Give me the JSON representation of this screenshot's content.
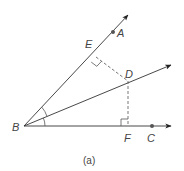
{
  "diagram": {
    "caption": "(a)",
    "points": {
      "A": {
        "label": "A",
        "x": 113,
        "y": 32
      },
      "B": {
        "label": "B",
        "x": 24,
        "y": 126
      },
      "C": {
        "label": "C",
        "x": 152,
        "y": 126
      },
      "D": {
        "label": "D",
        "x": 128,
        "y": 81
      },
      "E": {
        "label": "E",
        "x": 96,
        "y": 57
      },
      "F": {
        "label": "F",
        "x": 128,
        "y": 126
      }
    },
    "rays": [
      {
        "name": "ray-BA",
        "from": "B",
        "through": "A"
      },
      {
        "name": "ray-BD",
        "from": "B",
        "through": "D",
        "note": "angle bisector"
      },
      {
        "name": "ray-BC",
        "from": "B",
        "through": "C"
      }
    ],
    "dashed_segments": [
      {
        "name": "DE",
        "from": "D",
        "to": "E",
        "note": "perpendicular to BA"
      },
      {
        "name": "DF",
        "from": "D",
        "to": "F",
        "note": "perpendicular to BC"
      }
    ],
    "right_angle_marks": [
      "E",
      "F"
    ],
    "angle_arcs": [
      "ABD",
      "DBC"
    ],
    "colors": {
      "line": "#333333",
      "dashed": "#666666",
      "text": "#444444"
    }
  }
}
